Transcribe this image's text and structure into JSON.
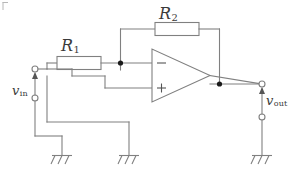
{
  "figure": {
    "type": "schematic",
    "width": 302,
    "height": 183,
    "background_color": "#ffffff",
    "wire_color": "#808080",
    "text_color": "#3a3a3a",
    "node_color": "#1a1a1a"
  },
  "labels": {
    "r1": {
      "symbol": "R",
      "subscript": "1",
      "text": "R1"
    },
    "r2": {
      "symbol": "R",
      "subscript": "2",
      "text": "R2"
    },
    "vin": {
      "symbol": "v",
      "subscript": "in",
      "text": "vin"
    },
    "vout": {
      "symbol": "v",
      "subscript": "out",
      "text": "vout"
    },
    "opamp_inverting": "−",
    "opamp_noninverting": "+"
  },
  "components": [
    {
      "name": "resistor-r1",
      "kind": "resistor",
      "label": "R1"
    },
    {
      "name": "resistor-r2",
      "kind": "resistor",
      "label": "R2"
    },
    {
      "name": "opamp",
      "kind": "operational-amplifier",
      "inputs": [
        "−",
        "+"
      ],
      "outputs": [
        "out"
      ]
    },
    {
      "name": "ground-input-return",
      "kind": "ground"
    },
    {
      "name": "ground-noninverting",
      "kind": "ground"
    },
    {
      "name": "ground-output-return",
      "kind": "ground"
    }
  ],
  "terminals": [
    {
      "name": "vin-positive-terminal",
      "kind": "open-circle"
    },
    {
      "name": "vin-negative-terminal",
      "kind": "open-circle"
    },
    {
      "name": "vout-positive-terminal",
      "kind": "open-circle"
    },
    {
      "name": "vout-negative-terminal",
      "kind": "open-circle"
    }
  ],
  "nodes": [
    {
      "name": "inverting-input-node",
      "kind": "junction-dot"
    },
    {
      "name": "output-node",
      "kind": "junction-dot"
    }
  ]
}
